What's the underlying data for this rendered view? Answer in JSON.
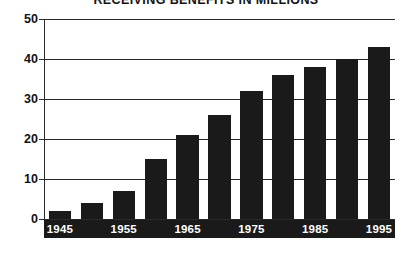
{
  "chart_data": {
    "type": "bar",
    "title": "RECEIVING BENEFITS IN MILLIONS",
    "xlabel": "",
    "ylabel": "",
    "categories": [
      "1945",
      "1950",
      "1955",
      "1960",
      "1965",
      "1970",
      "1975",
      "1980",
      "1985",
      "1990",
      "1995"
    ],
    "values": [
      2,
      4,
      7,
      15,
      21,
      26,
      32,
      36,
      38,
      40,
      43
    ],
    "visible_tick_labels": [
      "1945",
      "1955",
      "1965",
      "1975",
      "1985",
      "1995"
    ],
    "ytick_labels": [
      "0",
      "10",
      "20",
      "30",
      "40",
      "50"
    ],
    "ytick_values": [
      0,
      10,
      20,
      30,
      40,
      50
    ],
    "ylim": [
      0,
      50
    ],
    "grid": true,
    "legend": "none",
    "bar_color": "#1a1a1a",
    "axis_color": "#2a2a2a",
    "label_band_color": "#1a1a1a",
    "label_text_color": "#ffffff",
    "background_color": "#ffffff"
  }
}
